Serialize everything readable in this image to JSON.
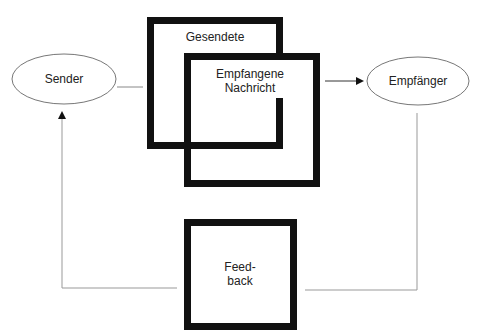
{
  "diagram": {
    "nodes": {
      "sender": {
        "label": "Sender"
      },
      "receiver": {
        "label": "Empfänger"
      },
      "sent_message": {
        "label": "Gesendete"
      },
      "received_message": {
        "line1": "Empfangene",
        "line2": "Nachricht"
      },
      "feedback": {
        "line1": "Feed-",
        "line2": "back"
      }
    },
    "edges": [
      {
        "from": "Sender",
        "to": "Gesendete"
      },
      {
        "from": "Empfangene Nachricht",
        "to": "Empfänger",
        "arrow": true
      },
      {
        "from": "Empfänger",
        "to": "Feedback"
      },
      {
        "from": "Feedback",
        "to": "Sender",
        "arrow": true
      }
    ],
    "colors": {
      "box_border": "#111111",
      "line": "#888888",
      "text": "#222222"
    }
  }
}
